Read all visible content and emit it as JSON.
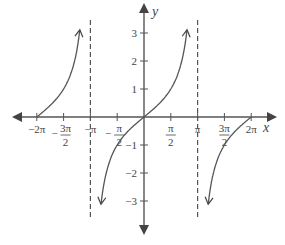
{
  "chart_data": {
    "type": "line",
    "title": "",
    "function": "y = tan(x/2)",
    "xlabel": "x",
    "ylabel": "y",
    "xlim": [
      -6.6,
      7.0
    ],
    "ylim": [
      -4.3,
      4.0
    ],
    "grid": false,
    "legend": "none",
    "x_ticks": [
      {
        "value": -6.2832,
        "label_num": "−2π",
        "label_den": ""
      },
      {
        "value": -4.7124,
        "label_num": "−3π",
        "label_den": "2"
      },
      {
        "value": -3.1416,
        "label_num": "−π",
        "label_den": ""
      },
      {
        "value": -1.5708,
        "label_num": "−π",
        "label_den": "2"
      },
      {
        "value": 1.5708,
        "label_num": "π",
        "label_den": "2"
      },
      {
        "value": 3.1416,
        "label_num": "π",
        "label_den": ""
      },
      {
        "value": 4.7124,
        "label_num": "3π",
        "label_den": "2"
      },
      {
        "value": 6.2832,
        "label_num": "2π",
        "label_den": ""
      }
    ],
    "y_ticks": [
      {
        "value": 3,
        "label": "3"
      },
      {
        "value": 2,
        "label": "2"
      },
      {
        "value": 1,
        "label": "1"
      },
      {
        "value": -1,
        "label": "−1"
      },
      {
        "value": -2,
        "label": "−2"
      },
      {
        "value": -3,
        "label": "−3"
      }
    ],
    "asymptotes": [
      -3.1416,
      3.1416
    ],
    "branches": [
      {
        "name": "left-branch",
        "x_start": -6.2832,
        "x_end": -3.1416,
        "y_max": 3.2
      },
      {
        "name": "middle-branch",
        "x_start": -3.1416,
        "x_end": 3.1416,
        "y_min": -3.2,
        "y_max": 3.2
      },
      {
        "name": "right-branch",
        "x_start": 3.1416,
        "x_end": 6.2832,
        "y_min": -3.2
      }
    ]
  }
}
